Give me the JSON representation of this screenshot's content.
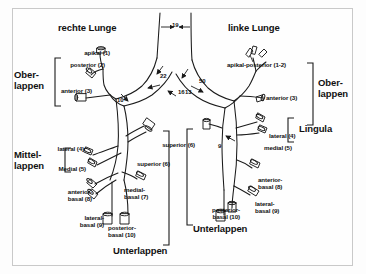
{
  "figure": {
    "title_left": "rechte Lunge",
    "title_right": "linke Lunge",
    "colors": {
      "ink": "#111111",
      "line": "#1a1a1a",
      "background": "#fefefe",
      "frame": "#c9c9c9"
    }
  },
  "right_lung": {
    "lobes": {
      "upper": "Ober-\nlappen",
      "middle": "Mittel-\nlappen",
      "lower": "Unterlappen"
    },
    "segments": {
      "apikal": "apikal (1)",
      "posterior": "posterior (2)",
      "anterior": "anterior (3)",
      "lateral": "lateral (4)",
      "medial": "Medial (5)",
      "superior": "superior  (6)",
      "medial_basal": "medial-\nbasal (7)",
      "anterior_basal": "anterior-\nbasal (8)",
      "lateral_basal": "lateral-\nbasal (9)",
      "posterior_basal": "posterior-\nbasal (10)"
    }
  },
  "left_lung": {
    "lobes": {
      "upper": "Ober-\nlappen",
      "lingula": "Lingula",
      "lower": "Unterlappen"
    },
    "segments": {
      "apikal_posterior": "apikal-posterior (1-2)",
      "anterior": "anterior (3)",
      "lateral": "lateral (4)",
      "medial": "medial (5)",
      "superior": "superior  (6)",
      "anterior_basal": "anterior-\nbasal (8)",
      "lateral_basal": "lateral-\nbasal (9)",
      "posterior_basal": "posterior-\nbasal (10)"
    }
  },
  "angles": {
    "trachea_width": "19",
    "right_main_upper": "22",
    "right_main_lower": "16",
    "right_upper_branch": "10",
    "left_main_upper": "13",
    "left_main_lower": "50",
    "left_lower_branch": "9"
  }
}
